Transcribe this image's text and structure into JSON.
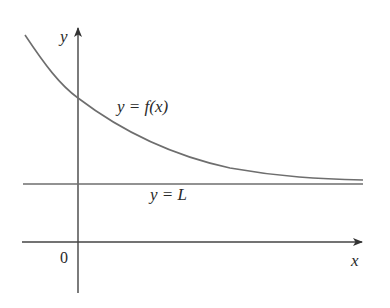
{
  "diagram": {
    "type": "function-graph",
    "axes": {
      "x_label": "x",
      "y_label": "y",
      "origin_label": "0"
    },
    "curve": {
      "label": "y = f(x)",
      "color": "#6e6e6e"
    },
    "asymptote": {
      "label": "y = L",
      "color": "#6e6e6e"
    },
    "axis_color": "#444444",
    "text_color": "#2a2a2a"
  }
}
